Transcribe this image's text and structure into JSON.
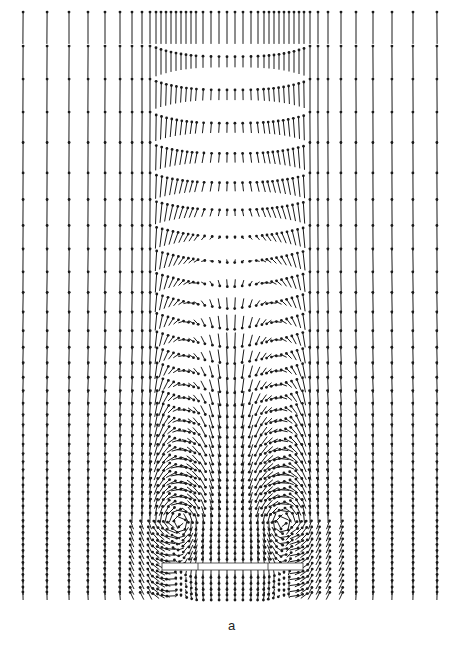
{
  "chart_data": {
    "type": "quiver",
    "title": "",
    "panel_label": "a",
    "xlabel": "",
    "ylabel": "",
    "axes_visible": false,
    "grid": false,
    "legend": null,
    "columns_x": [
      23,
      47,
      69,
      88,
      105,
      120,
      132,
      142,
      150,
      156,
      161,
      166,
      171,
      176,
      181,
      186,
      191,
      196,
      203,
      211,
      219,
      227,
      235,
      243,
      251,
      258,
      264,
      269,
      274,
      279,
      284,
      289,
      294,
      299,
      304,
      310,
      318,
      328,
      341,
      356,
      373,
      392,
      413,
      437
    ],
    "rows_y": [
      28,
      62,
      95,
      128,
      158,
      187,
      213,
      238,
      261,
      283,
      303,
      322,
      340,
      356,
      371,
      385,
      398,
      410,
      421,
      431,
      441,
      450,
      459,
      467,
      475,
      483,
      490,
      497,
      504,
      511,
      518,
      525,
      531,
      537,
      543,
      549,
      555,
      561,
      567,
      573,
      579,
      585,
      591,
      596
    ],
    "plate": {
      "x0": 162,
      "x1": 303,
      "y0": 563,
      "y1": 570,
      "dividers_x": [
        198,
        268
      ]
    },
    "field_model": {
      "center_x": 231,
      "wake_half_width": 78,
      "outer_speed": 32,
      "vortex_centers": [
        [
          180,
          520
        ],
        [
          282,
          520
        ]
      ],
      "vortex_strength": 14,
      "wake_top_y": 200,
      "wake_down_speed": 12
    },
    "arrow_color": "#1a1a1a",
    "plate_color": "#333333"
  }
}
